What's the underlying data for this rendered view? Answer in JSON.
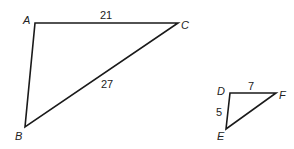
{
  "triangles": [
    {
      "name": "ABC",
      "vertices": {
        "A": {
          "label": "A",
          "x": 35,
          "y": 23
        },
        "B": {
          "label": "B",
          "x": 25,
          "y": 127
        },
        "C": {
          "label": "C",
          "x": 178,
          "y": 23
        }
      },
      "sides": {
        "AC": "21",
        "BC": "27"
      }
    },
    {
      "name": "DEF",
      "vertices": {
        "D": {
          "label": "D",
          "x": 230,
          "y": 93
        },
        "E": {
          "label": "E",
          "x": 226,
          "y": 129
        },
        "F": {
          "label": "F",
          "x": 276,
          "y": 93
        }
      },
      "sides": {
        "DF": "7",
        "DE": "5"
      }
    }
  ],
  "colors": {
    "stroke": "#1a1a1a",
    "text": "#222222",
    "background": "#ffffff"
  }
}
